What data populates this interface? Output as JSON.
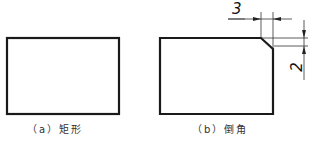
{
  "figures": [
    {
      "id": "a",
      "caption": "（a）矩形",
      "shape": "rectangle"
    },
    {
      "id": "b",
      "caption": "（b）倒角",
      "shape": "rectangle-with-chamfer",
      "dimensions": {
        "horizontal": "3",
        "vertical": "2"
      }
    }
  ],
  "colors": {
    "outline": "#1a1a1a",
    "dimension_line": "#333333",
    "background": "#ffffff"
  }
}
